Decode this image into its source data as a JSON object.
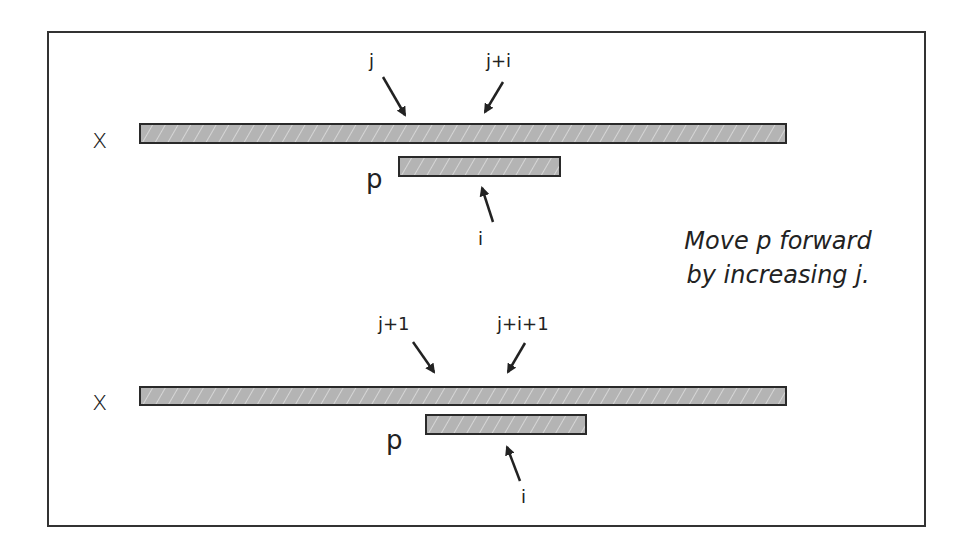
{
  "diagram": {
    "type": "string-matching-shift-illustration",
    "colors": {
      "bar_fill": "#b4b4b4",
      "bar_border": "#2a2a2a",
      "frame": "#333333",
      "text": "#222222"
    },
    "note": {
      "line1": "Move p forward",
      "line2": "by increasing j."
    },
    "panels": [
      {
        "id": "before",
        "text_label": "x",
        "pattern_label": "p",
        "pointers": {
          "text_start": "j",
          "text_current": "j+i",
          "pattern_current": "i"
        }
      },
      {
        "id": "after",
        "text_label": "x",
        "pattern_label": "p",
        "pointers": {
          "text_start": "j+1",
          "text_current": "j+i+1",
          "pattern_current": "i"
        }
      }
    ]
  }
}
